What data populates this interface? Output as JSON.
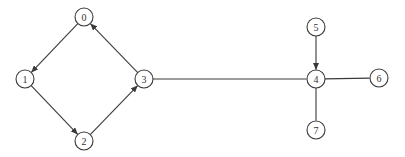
{
  "diagram": {
    "type": "graph",
    "node_radius": 9,
    "colors": {
      "stroke": "#3a3a3a",
      "text": "#333333",
      "background": "#ffffff"
    },
    "nodes": [
      {
        "id": "0",
        "label": "0",
        "x": 84,
        "y": 17
      },
      {
        "id": "1",
        "label": "1",
        "x": 25,
        "y": 79
      },
      {
        "id": "2",
        "label": "2",
        "x": 84,
        "y": 141
      },
      {
        "id": "3",
        "label": "3",
        "x": 144,
        "y": 79
      },
      {
        "id": "4",
        "label": "4",
        "x": 316,
        "y": 79
      },
      {
        "id": "5",
        "label": "5",
        "x": 316,
        "y": 27
      },
      {
        "id": "6",
        "label": "6",
        "x": 379,
        "y": 78
      },
      {
        "id": "7",
        "label": "7",
        "x": 316,
        "y": 130
      }
    ],
    "edges": [
      {
        "from": "0",
        "to": "1",
        "directed": true
      },
      {
        "from": "1",
        "to": "2",
        "directed": true
      },
      {
        "from": "2",
        "to": "3",
        "directed": true
      },
      {
        "from": "3",
        "to": "0",
        "directed": true
      },
      {
        "from": "3",
        "to": "4",
        "directed": false
      },
      {
        "from": "5",
        "to": "4",
        "directed": true
      },
      {
        "from": "4",
        "to": "6",
        "directed": false
      },
      {
        "from": "4",
        "to": "7",
        "directed": false
      }
    ]
  }
}
